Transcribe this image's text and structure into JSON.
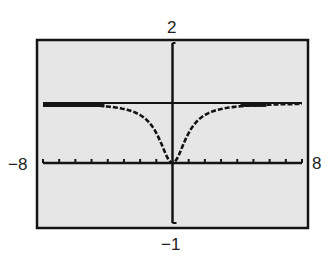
{
  "chart_data": {
    "type": "line",
    "title": "",
    "xlabel": "",
    "ylabel": "",
    "xlim": [
      -8,
      8
    ],
    "ylim": [
      -1,
      2
    ],
    "x_tick_step": 1,
    "grid": false,
    "window_labels": {
      "ymax": "2",
      "ymin": "−1",
      "xmin": "−8",
      "xmax": "8"
    },
    "series": [
      {
        "name": "f(x)",
        "description": "graph approaching horizontal asymptote y = 1, touching 0 at x = 0",
        "x": [
          -8,
          -6,
          -4,
          -3,
          -2,
          -1.5,
          -1,
          -0.5,
          0,
          0.5,
          1,
          1.5,
          2,
          3,
          4,
          6,
          8
        ],
        "values": [
          0.98,
          0.97,
          0.94,
          0.9,
          0.8,
          0.69,
          0.5,
          0.2,
          0,
          0.2,
          0.5,
          0.69,
          0.8,
          0.9,
          0.94,
          0.97,
          0.98
        ]
      },
      {
        "name": "asymptote",
        "description": "horizontal line y = 1",
        "x": [
          -8,
          8
        ],
        "values": [
          1,
          1
        ]
      }
    ]
  },
  "colors": {
    "screen_bg": "#e6e6e6",
    "ink": "#141414",
    "page_bg": "#ffffff"
  }
}
